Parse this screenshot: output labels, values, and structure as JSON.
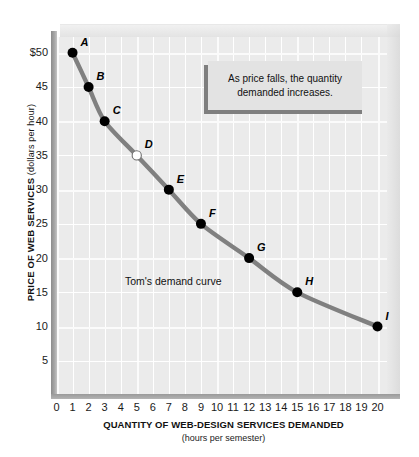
{
  "chart_data": {
    "type": "line",
    "title": "",
    "xlabel": "QUANTITY OF WEB-DESIGN SERVICES DEMANDED",
    "xsublabel": "(hours per semester)",
    "ylabel": "PRICE OF WEB SERVICES",
    "ysublabel": "(dollars per hour)",
    "xlim": [
      0,
      20
    ],
    "ylim": [
      0,
      52
    ],
    "xticks": [
      "0",
      "1",
      "2",
      "3",
      "4",
      "5",
      "6",
      "7",
      "8",
      "9",
      "10",
      "11",
      "12",
      "13",
      "14",
      "15",
      "16",
      "17",
      "18",
      "19",
      "20"
    ],
    "xtick_values": [
      0,
      1,
      2,
      3,
      4,
      5,
      6,
      7,
      8,
      9,
      10,
      11,
      12,
      13,
      14,
      15,
      16,
      17,
      18,
      19,
      20
    ],
    "yticks": [
      "$50",
      "45",
      "40",
      "35",
      "30",
      "25",
      "20",
      "15",
      "10",
      "5"
    ],
    "ytick_values": [
      50,
      45,
      40,
      35,
      30,
      25,
      20,
      15,
      10,
      5
    ],
    "grid": true,
    "legend": "none",
    "series": [
      {
        "name": "Tom's demand curve",
        "color": "#808080",
        "x": [
          1,
          2,
          3,
          5,
          7,
          9,
          12,
          15,
          20
        ],
        "y": [
          50,
          45,
          40,
          35,
          30,
          25,
          20,
          15,
          10
        ],
        "point_labels": [
          "A",
          "B",
          "C",
          "D",
          "E",
          "F",
          "G",
          "H",
          "I"
        ],
        "points": [
          {
            "label": "A",
            "x": 1,
            "y": 50,
            "filled": true
          },
          {
            "label": "B",
            "x": 2,
            "y": 45,
            "filled": true
          },
          {
            "label": "C",
            "x": 3,
            "y": 40,
            "filled": true
          },
          {
            "label": "D",
            "x": 5,
            "y": 35,
            "filled": false
          },
          {
            "label": "E",
            "x": 7,
            "y": 30,
            "filled": true
          },
          {
            "label": "F",
            "x": 9,
            "y": 25,
            "filled": true
          },
          {
            "label": "G",
            "x": 12,
            "y": 20,
            "filled": true
          },
          {
            "label": "H",
            "x": 15,
            "y": 15,
            "filled": true
          },
          {
            "label": "I",
            "x": 20,
            "y": 10,
            "filled": true
          }
        ]
      }
    ],
    "annotations": [
      {
        "name": "curve-note",
        "text": "Tom's demand curve"
      },
      {
        "name": "callout",
        "text": "As price falls, the quantity demanded increases."
      }
    ]
  },
  "callout": {
    "line1": "As price falls, the quantity",
    "line2": "demanded increases."
  },
  "colors": {
    "curve": "#808080",
    "point_fill": "#000000",
    "point_hollow_fill": "#ffffff",
    "plot_background": "#ebebeb",
    "grid": "#ffffff",
    "axis": "#9a9a9a",
    "callout_background": "#e3e3e3",
    "callout_shadow": "#7f7f7f",
    "text": "#111111"
  }
}
